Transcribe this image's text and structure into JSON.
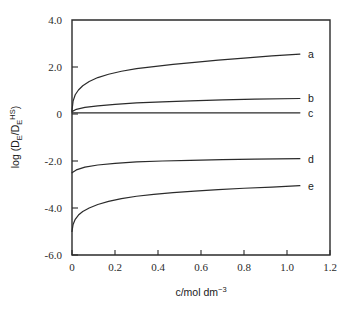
{
  "chart_data": {
    "type": "line",
    "title": "",
    "xlabel": "c/mol dm-3",
    "xlabel_parts": {
      "base": "c/mol dm",
      "exponent": "−3"
    },
    "ylabel": "log (DE/DEHS)",
    "ylabel_parts": {
      "lead": "log (D",
      "sub1": "E",
      "mid": "/D",
      "sub2": "E",
      "sup": "HS",
      "tail": ")"
    },
    "xlim": [
      0,
      1.2
    ],
    "ylim": [
      -6.0,
      4.0
    ],
    "xticks": [
      0,
      0.2,
      0.4,
      0.6,
      0.8,
      1.0,
      1.2
    ],
    "xtick_labels": [
      "0",
      "0.2",
      "0.4",
      "0.6",
      "0.8",
      "1.0",
      "1.2"
    ],
    "yticks": [
      -6.0,
      -4.0,
      -2.0,
      0,
      2.0,
      4.0
    ],
    "ytick_labels": [
      "-6.0",
      "-4.0",
      "-2.0",
      "0",
      "2.0",
      "4.0"
    ],
    "grid": false,
    "legend_position": "right-inline",
    "line_color": "#2b2b2b",
    "series": [
      {
        "name": "a",
        "label": "a",
        "x": [
          0.0,
          0.005,
          0.015,
          0.03,
          0.05,
          0.08,
          0.12,
          0.17,
          0.23,
          0.3,
          0.38,
          0.47,
          0.57,
          0.68,
          0.8,
          0.93,
          1.06
        ],
        "values": [
          0.15,
          0.55,
          0.82,
          1.02,
          1.2,
          1.38,
          1.55,
          1.69,
          1.82,
          1.93,
          2.02,
          2.11,
          2.2,
          2.29,
          2.38,
          2.47,
          2.55
        ]
      },
      {
        "name": "b",
        "label": "b",
        "x": [
          0.0,
          0.02,
          0.06,
          0.12,
          0.2,
          0.3,
          0.42,
          0.55,
          0.7,
          0.85,
          1.06
        ],
        "values": [
          0.1,
          0.2,
          0.28,
          0.35,
          0.41,
          0.47,
          0.52,
          0.56,
          0.6,
          0.63,
          0.66
        ]
      },
      {
        "name": "c",
        "label": "c",
        "x": [
          0.0,
          0.2,
          0.5,
          0.8,
          1.06
        ],
        "values": [
          0.05,
          0.05,
          0.05,
          0.05,
          0.05
        ]
      },
      {
        "name": "d",
        "label": "d",
        "x": [
          0.0,
          0.02,
          0.06,
          0.12,
          0.2,
          0.3,
          0.42,
          0.55,
          0.7,
          0.85,
          1.06
        ],
        "values": [
          -2.5,
          -2.38,
          -2.26,
          -2.17,
          -2.1,
          -2.04,
          -2.0,
          -1.97,
          -1.94,
          -1.92,
          -1.9
        ]
      },
      {
        "name": "e",
        "label": "e",
        "x": [
          0.0,
          0.005,
          0.015,
          0.03,
          0.05,
          0.08,
          0.12,
          0.17,
          0.23,
          0.3,
          0.38,
          0.47,
          0.57,
          0.68,
          0.8,
          0.93,
          1.06
        ],
        "values": [
          -5.0,
          -4.7,
          -4.48,
          -4.3,
          -4.15,
          -4.0,
          -3.85,
          -3.72,
          -3.6,
          -3.5,
          -3.42,
          -3.35,
          -3.28,
          -3.22,
          -3.16,
          -3.11,
          -3.05
        ]
      }
    ]
  }
}
